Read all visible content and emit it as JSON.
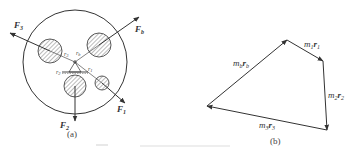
{
  "figure_a": {
    "caption": "(a)",
    "forces": {
      "F3": {
        "base": "F",
        "sub": "3"
      },
      "Fb": {
        "base": "F",
        "sub": "b"
      },
      "F2": {
        "base": "F",
        "sub": "2"
      },
      "F1": {
        "base": "F",
        "sub": "1"
      }
    },
    "radii": {
      "r3": {
        "base": "r",
        "sub": "3"
      },
      "rb": {
        "base": "r",
        "sub": "b"
      },
      "r2": {
        "base": "r",
        "sub": "2"
      },
      "r1": {
        "base": "r",
        "sub": "1"
      }
    }
  },
  "figure_b": {
    "caption": "(b)",
    "vectors": {
      "m1r1": {
        "m": "m",
        "msub": "1",
        "r": "r",
        "rsub": "1"
      },
      "m2r2": {
        "m": "m",
        "msub": "2",
        "r": "r",
        "rsub": "2"
      },
      "m3r3": {
        "m": "m",
        "msub": "3",
        "r": "r",
        "rsub": "3"
      },
      "mbrb": {
        "m": "m",
        "msub": "b",
        "r": "r",
        "rsub": "b"
      }
    }
  },
  "colors": {
    "stroke": "#333333",
    "caption_faint": "#e6e6e6"
  }
}
